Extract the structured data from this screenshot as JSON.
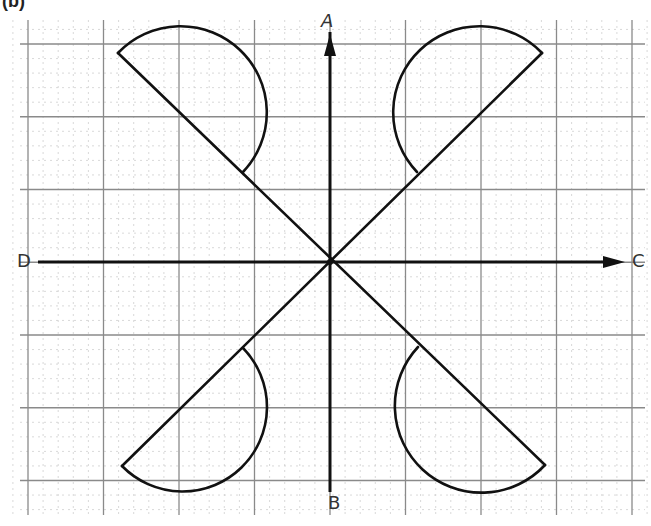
{
  "figure": {
    "label": "(b)",
    "width": 651,
    "height": 526,
    "colors": {
      "background": "#ffffff",
      "grid_minor": "#c9c9c9",
      "grid_major": "#8a8a8a",
      "ink": "#111111",
      "label": "#333333"
    }
  },
  "grid": {
    "x_start": 28,
    "y_start": 44,
    "minor_spacing_x": 15.1,
    "minor_spacing_y": 14.55,
    "major_every": 5,
    "cols": 40,
    "rows": 30,
    "left": 20,
    "top": 20,
    "right": 645,
    "bottom": 515
  },
  "axes": {
    "origin": [
      330,
      262
    ],
    "vertical": {
      "from_label": "A",
      "to_label": "B",
      "top": [
        330,
        18
      ],
      "bottom": [
        330,
        492
      ],
      "arrow_at": "top"
    },
    "horizontal": {
      "from_label": "D",
      "to_label": "C",
      "left": [
        38,
        262
      ],
      "right": [
        625,
        262
      ],
      "arrow_at": "right"
    },
    "labels": [
      {
        "id": "A",
        "text": "A",
        "x": 321,
        "y": 12
      },
      {
        "id": "B",
        "text": "B",
        "x": 328,
        "y": 494
      },
      {
        "id": "C",
        "text": "C",
        "x": 632,
        "y": 252
      },
      {
        "id": "D",
        "text": "D",
        "x": 17,
        "y": 252
      }
    ]
  },
  "diagonals": [
    {
      "name": "diagonal-nw-se",
      "from": [
        118,
        53
      ],
      "to": [
        545,
        465
      ]
    },
    {
      "name": "diagonal-ne-sw",
      "from": [
        542,
        53
      ],
      "to": [
        122,
        466
      ]
    }
  ],
  "semicircles": [
    {
      "name": "semicircle-top-left",
      "p1": [
        118,
        53
      ],
      "p2": [
        243,
        172
      ],
      "sweep": 1
    },
    {
      "name": "semicircle-top-right",
      "p1": [
        542,
        53
      ],
      "p2": [
        417,
        172
      ],
      "sweep": 0
    },
    {
      "name": "semicircle-bottom-left",
      "p1": [
        122,
        466
      ],
      "p2": [
        243,
        348
      ],
      "sweep": 0
    },
    {
      "name": "semicircle-bottom-right",
      "p1": [
        545,
        465
      ],
      "p2": [
        418,
        347
      ],
      "sweep": 1
    }
  ]
}
